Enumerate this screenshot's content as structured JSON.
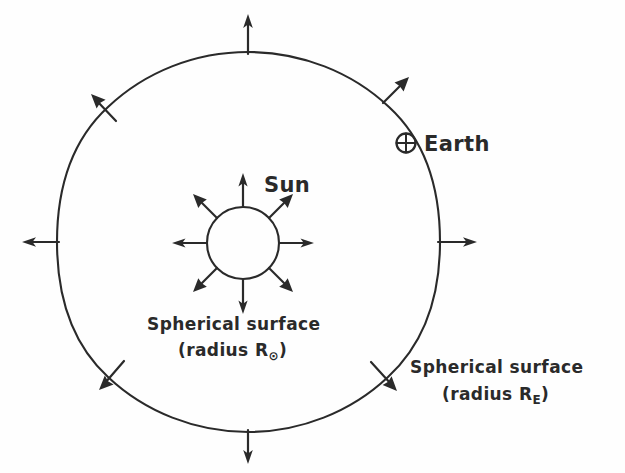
{
  "figure": {
    "kind": "hand-drawn physics diagram",
    "ink_color": "#2a2a2a",
    "paper_color": "#fefefe"
  },
  "labels": {
    "sun": "Sun",
    "earth": "Earth",
    "inner_surface_line1": "Spherical surface",
    "inner_surface_line2_prefix": "(radius R",
    "inner_surface_subscript": "⊙",
    "inner_surface_line2_suffix": ")",
    "outer_surface_line1": "Spherical surface",
    "outer_surface_line2_prefix": "(radius R",
    "outer_surface_subscript": "E",
    "outer_surface_line2_suffix": ")"
  },
  "symbols": {
    "earth_glyph": "⊕",
    "sun_glyph": "⊙"
  },
  "geometry": {
    "sun_circle": {
      "cx": 243,
      "cy": 243,
      "r": 36
    },
    "outer_circle": {
      "cx": 248,
      "cy": 242,
      "rx": 192,
      "ry": 190
    },
    "earth_marker": {
      "cx": 406,
      "cy": 143,
      "r": 10
    },
    "arrow_count_inner": 8,
    "arrow_count_outer": 8,
    "arrow_angles_deg": [
      0,
      45,
      90,
      135,
      180,
      225,
      270,
      315
    ]
  }
}
